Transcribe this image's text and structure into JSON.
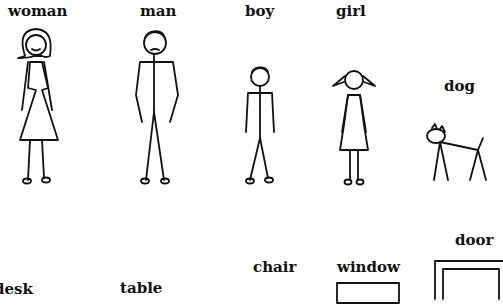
{
  "worksheet": {
    "items": [
      {
        "word": "woman"
      },
      {
        "word": "man"
      },
      {
        "word": "boy"
      },
      {
        "word": "girl"
      },
      {
        "word": "dog"
      },
      {
        "word": "desk"
      },
      {
        "word": "table"
      },
      {
        "word": "chair"
      },
      {
        "word": "window"
      },
      {
        "word": "door"
      }
    ]
  }
}
